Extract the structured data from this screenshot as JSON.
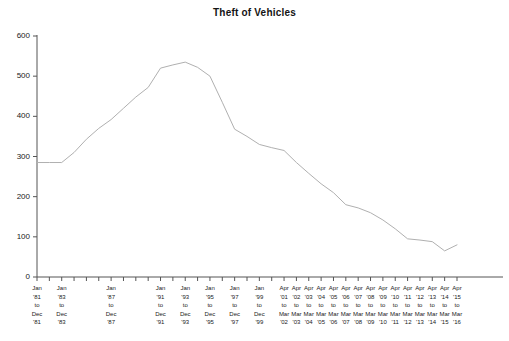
{
  "chart": {
    "title": "Theft of Vehicles",
    "line_color": "#b0b0b0",
    "axis_color": "#555555",
    "text_color": "#222222"
  },
  "chart_data": {
    "type": "line",
    "title": "Theft of Vehicles",
    "xlabel": "",
    "ylabel": "",
    "ylim": [
      0,
      600
    ],
    "yticks": [
      0,
      100,
      200,
      300,
      400,
      500,
      600
    ],
    "grid": false,
    "legend": null,
    "categories": [
      "Jan '81 to Dec '81",
      "Jan '82 to Dec '82",
      "Jan '83 to Dec '83",
      "Jan '84 to Dec '84",
      "Jan '85 to Dec '85",
      "Jan '86 to Dec '86",
      "Jan '87 to Dec '87",
      "Jan '88 to Dec '88",
      "Jan '89 to Dec '89",
      "Jan '90 to Dec '90",
      "Jan '91 to Dec '91",
      "Jan '92 to Dec '92",
      "Jan '93 to Dec '93",
      "Jan '94 to Dec '94",
      "Jan '95 to Dec '95",
      "Jan '96 to Dec '96",
      "Jan '97 to Dec '97",
      "Jan '98 to Dec '98",
      "Jan '99 to Dec '99",
      "Apr '00 to Mar '01",
      "Apr '01 to Mar '02",
      "Apr '02 to Mar '03",
      "Apr '03 to Mar '04",
      "Apr '04 to Mar '05",
      "Apr '05 to Mar '06",
      "Apr '06 to Mar '07",
      "Apr '07 to Mar '08",
      "Apr '08 to Mar '09",
      "Apr '09 to Mar '10",
      "Apr '10 to Mar '11",
      "Apr '11 to Mar '12",
      "Apr '12 to Mar '13",
      "Apr '13 to Mar '14",
      "Apr '14 to Mar '15",
      "Apr '15 to Mar '16"
    ],
    "values": [
      285,
      285,
      285,
      310,
      343,
      370,
      392,
      420,
      448,
      472,
      520,
      528,
      535,
      522,
      500,
      435,
      368,
      350,
      330,
      322,
      315,
      285,
      258,
      232,
      210,
      180,
      172,
      160,
      142,
      120,
      95,
      92,
      88,
      65,
      80
    ]
  },
  "y_axis": {
    "ticks": [
      "600",
      "500",
      "400",
      "300",
      "200",
      "100",
      "0"
    ]
  },
  "x_axis": {
    "labels": [
      {
        "index": 0,
        "line1": "Jan",
        "line2": "'81",
        "line3": "to",
        "line4": "Dec",
        "line5": "'81"
      },
      {
        "index": 2,
        "line1": "Jan",
        "line2": "'83",
        "line3": "to",
        "line4": "Dec",
        "line5": "'83"
      },
      {
        "index": 6,
        "line1": "Jan",
        "line2": "'87",
        "line3": "to",
        "line4": "Dec",
        "line5": "'87"
      },
      {
        "index": 10,
        "line1": "Jan",
        "line2": "'91",
        "line3": "to",
        "line4": "Dec",
        "line5": "'91"
      },
      {
        "index": 12,
        "line1": "Jan",
        "line2": "'93",
        "line3": "to",
        "line4": "Dec",
        "line5": "'93"
      },
      {
        "index": 14,
        "line1": "Jan",
        "line2": "'95",
        "line3": "to",
        "line4": "Dec",
        "line5": "'95"
      },
      {
        "index": 16,
        "line1": "Jan",
        "line2": "'97",
        "line3": "to",
        "line4": "Dec",
        "line5": "'97"
      },
      {
        "index": 18,
        "line1": "Jan",
        "line2": "'99",
        "line3": "to",
        "line4": "Dec",
        "line5": "'99"
      },
      {
        "index": 20,
        "line1": "Apr",
        "line2": "'01",
        "line3": "to",
        "line4": "Mar",
        "line5": "'02"
      },
      {
        "index": 21,
        "line1": "Apr",
        "line2": "'02",
        "line3": "to",
        "line4": "Mar",
        "line5": "'03"
      },
      {
        "index": 22,
        "line1": "Apr",
        "line2": "'03",
        "line3": "to",
        "line4": "Mar",
        "line5": "'04"
      },
      {
        "index": 23,
        "line1": "Apr",
        "line2": "'04",
        "line3": "to",
        "line4": "Mar",
        "line5": "'05"
      },
      {
        "index": 24,
        "line1": "Apr",
        "line2": "'05",
        "line3": "to",
        "line4": "Mar",
        "line5": "'06"
      },
      {
        "index": 25,
        "line1": "Apr",
        "line2": "'06",
        "line3": "to",
        "line4": "Mar",
        "line5": "'07"
      },
      {
        "index": 26,
        "line1": "Apr",
        "line2": "'07",
        "line3": "to",
        "line4": "Mar",
        "line5": "'08"
      },
      {
        "index": 27,
        "line1": "Apr",
        "line2": "'08",
        "line3": "to",
        "line4": "Mar",
        "line5": "'09"
      },
      {
        "index": 28,
        "line1": "Apr",
        "line2": "'09",
        "line3": "to",
        "line4": "Mar",
        "line5": "'10"
      },
      {
        "index": 29,
        "line1": "Apr",
        "line2": "'10",
        "line3": "to",
        "line4": "Mar",
        "line5": "'11"
      },
      {
        "index": 30,
        "line1": "Apr",
        "line2": "'11",
        "line3": "to",
        "line4": "Mar",
        "line5": "'12"
      },
      {
        "index": 31,
        "line1": "Apr",
        "line2": "'12",
        "line3": "to",
        "line4": "Mar",
        "line5": "'13"
      },
      {
        "index": 32,
        "line1": "Apr",
        "line2": "'13",
        "line3": "to",
        "line4": "Mar",
        "line5": "'14"
      },
      {
        "index": 33,
        "line1": "Apr",
        "line2": "'14",
        "line3": "to",
        "line4": "Mar",
        "line5": "'15"
      },
      {
        "index": 34,
        "line1": "Apr",
        "line2": "'15",
        "line3": "to",
        "line4": "Mar",
        "line5": "'16"
      }
    ]
  }
}
